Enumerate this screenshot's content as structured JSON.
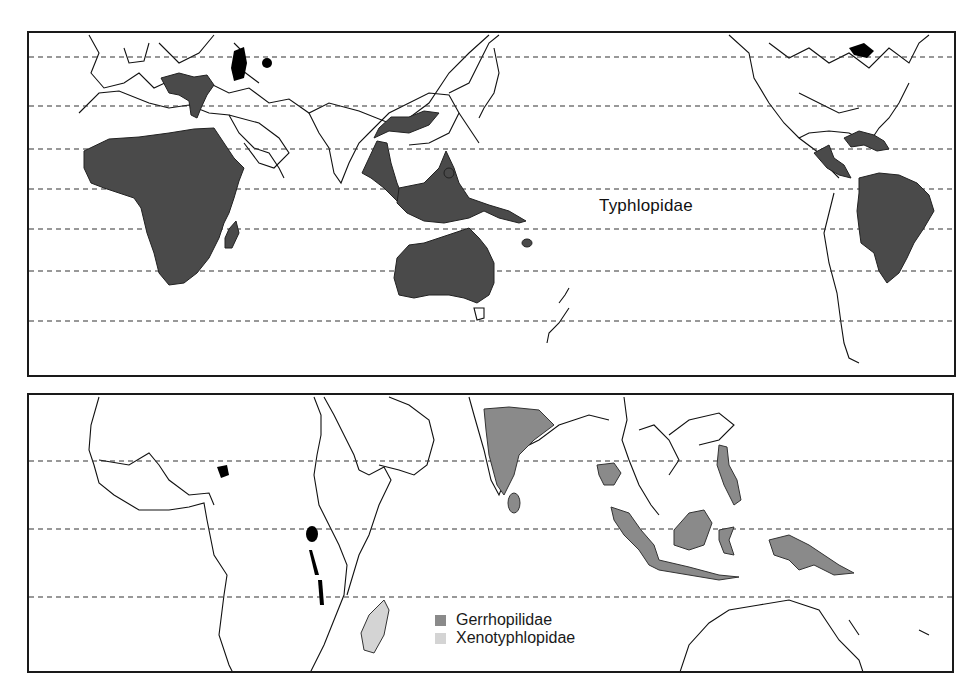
{
  "figure": {
    "panels": [
      {
        "id": "top",
        "projection": "world map, Africa-Asia-Pacific-Americas",
        "label": "Typhlopidae",
        "fill_color": "#4a4a4a",
        "latitude_lines": 7,
        "regions_shaded": [
          "Africa south of Sahara",
          "Madagascar",
          "Mediterranean / Asia Minor",
          "South & Southeast Asia",
          "Indonesia / New Guinea",
          "Australia",
          "Caribbean",
          "Central America",
          "Tropical South America"
        ]
      },
      {
        "id": "bottom",
        "projection": "regional map, Africa to Western Pacific",
        "latitude_lines": 3,
        "regions_shaded": {
          "Gerrhopilidae": [
            "India",
            "Sri Lanka",
            "Thailand",
            "Philippines",
            "Sumatra",
            "Java",
            "Borneo",
            "Sulawesi",
            "New Guinea"
          ],
          "Xenotyphlopidae": [
            "Madagascar"
          ]
        }
      }
    ],
    "legend": [
      {
        "label": "Gerrhopilidae",
        "color": "#8a8a8a"
      },
      {
        "label": "Xenotyphlopidae",
        "color": "#d4d4d4"
      }
    ]
  }
}
